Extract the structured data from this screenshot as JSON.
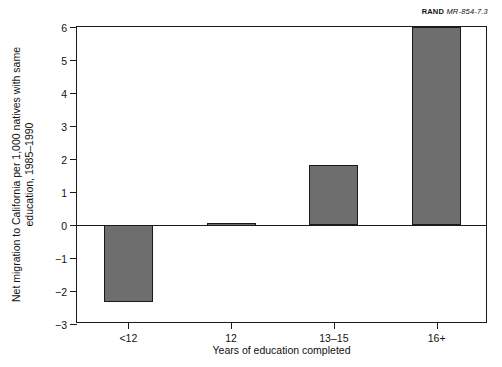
{
  "source_credit": {
    "organization": "RAND",
    "document": "MR-854-7.3"
  },
  "chart_data": {
    "type": "bar",
    "title": "",
    "subtitle": "",
    "categories": [
      "<12",
      "12",
      "13–15",
      "16+"
    ],
    "values": [
      -2.33,
      0.07,
      1.83,
      6.0
    ],
    "series": [
      {
        "name": "Net migration to California",
        "values": [
          -2.33,
          0.07,
          1.83,
          6.0
        ]
      }
    ],
    "xlabel": "Years of education completed",
    "ylabel": "Net migration to California per 1,000 natives with same education, 1985–1990",
    "ylim": [
      -3,
      6
    ],
    "yticks": [
      6,
      5,
      4,
      3,
      2,
      1,
      0,
      -1,
      -2,
      -3
    ],
    "ytick_labels": [
      "6",
      "5",
      "4",
      "3",
      "2",
      "1",
      "0",
      "−1",
      "−2",
      "−3"
    ],
    "grid": false,
    "legend": false,
    "legend_position": "none",
    "bar_color": "#6e6e6e",
    "bar_edge_color": "#1a1a1a",
    "axis_color": "#1a1a1a",
    "background_color": "#ffffff",
    "annotations": []
  }
}
